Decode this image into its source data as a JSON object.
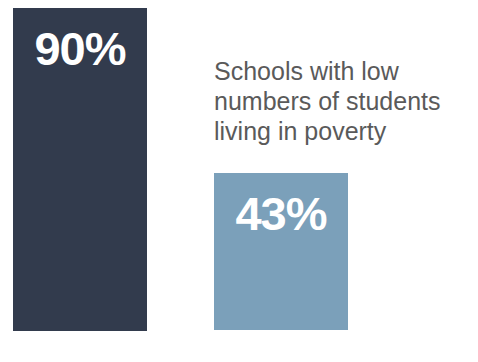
{
  "figure": {
    "background_color": "#ffffff",
    "width": 478,
    "height": 362
  },
  "caption": {
    "color": "#5a5a5a",
    "lines": [
      "Schools with low",
      "numbers of students",
      "living in poverty"
    ],
    "full_text": "Schools with low numbers of students living in poverty"
  },
  "bars": {
    "primary": {
      "label": "90%",
      "color": "#323b4d",
      "value_text_color": "#ffffff"
    },
    "secondary": {
      "label": "43%",
      "color": "#7ba0ba",
      "value_text_color": "#ffffff"
    }
  },
  "chart_data": {
    "type": "bar",
    "title": "",
    "subtitle": "",
    "xlabel": "",
    "ylabel": "",
    "categories": [
      "90%",
      "43%"
    ],
    "values": [
      90,
      43
    ],
    "data_labels": [
      "90%",
      "43%"
    ],
    "annotations": [
      "Schools with low numbers of students living in poverty"
    ],
    "colors": [
      "#323b4d",
      "#7ba0ba"
    ],
    "ylim": [
      0,
      90
    ],
    "grid": false,
    "legend": "none",
    "axis_visible": false,
    "units": "percent",
    "orientation": "vertical"
  }
}
